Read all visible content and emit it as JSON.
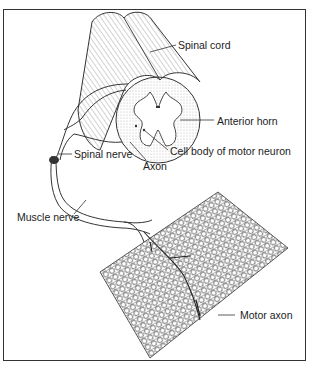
{
  "diagram": {
    "type": "anatomical illustration",
    "labels": {
      "spinal_cord": "Spinal cord",
      "anterior_horn": "Anterior horn",
      "cell_body": "Cell body of motor neuron",
      "spinal_nerve": "Spinal nerve",
      "axon": "Axon",
      "muscle_nerve": "Muscle nerve",
      "motor_axon": "Motor axon"
    }
  }
}
